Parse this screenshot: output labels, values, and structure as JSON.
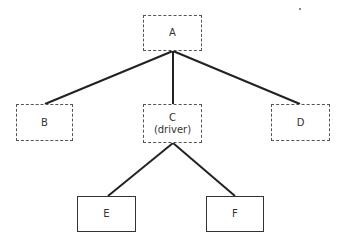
{
  "diagram": {
    "type": "tree",
    "nodes": [
      {
        "id": "A",
        "label": "A",
        "sublabel": "",
        "style": "dashed"
      },
      {
        "id": "B",
        "label": "B",
        "sublabel": "",
        "style": "dashed"
      },
      {
        "id": "C",
        "label": "C",
        "sublabel": "(driver)",
        "style": "dashed"
      },
      {
        "id": "D",
        "label": "D",
        "sublabel": "",
        "style": "dashed"
      },
      {
        "id": "E",
        "label": "E",
        "sublabel": "",
        "style": "solid"
      },
      {
        "id": "F",
        "label": "F",
        "sublabel": "",
        "style": "solid"
      }
    ],
    "edges": [
      {
        "from": "A",
        "to": "B"
      },
      {
        "from": "A",
        "to": "C"
      },
      {
        "from": "A",
        "to": "D"
      },
      {
        "from": "C",
        "to": "E"
      },
      {
        "from": "C",
        "to": "F"
      }
    ],
    "colors": {
      "line": "#222222",
      "box_border": "#555555",
      "text": "#333333"
    }
  }
}
